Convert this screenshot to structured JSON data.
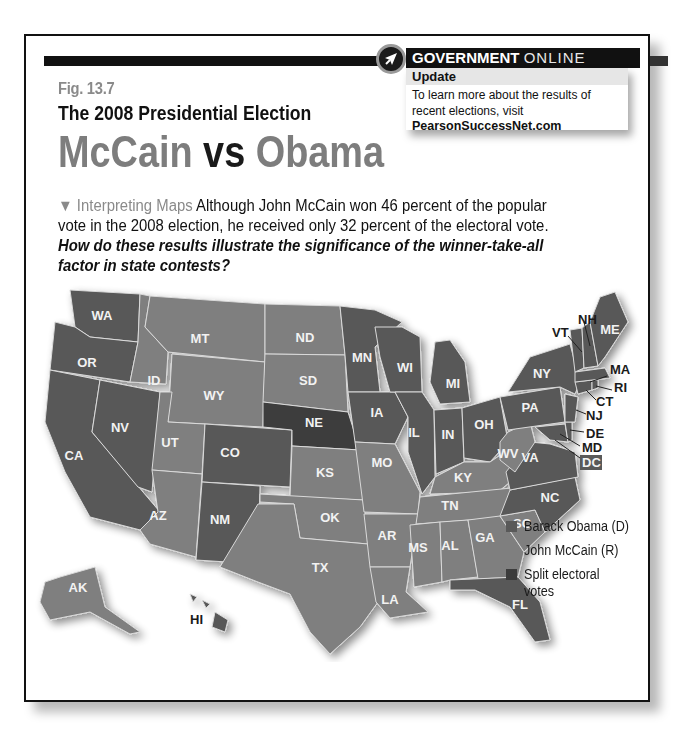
{
  "figure": {
    "number": "Fig. 13.7",
    "subtitle": "The 2008 Presidential Election",
    "title_left": "McCain",
    "title_mid": "vs",
    "title_right": "Obama"
  },
  "gov_online": {
    "icon": "arrow-cursor-icon",
    "heading_bold": "GOVERNMENT",
    "heading_light": "ONLINE",
    "tag": "Update",
    "text": "To learn more about the results of recent elections, visit",
    "link": "PearsonSuccessNet.com"
  },
  "caption": {
    "lead": "▼ Interpreting Maps",
    "body": " Although John McCain won 46 percent of the popular vote in the 2008 election, he received only 32 percent of the electoral vote. ",
    "question": "How do these results illustrate the significance of the winner-take-all factor in state contests?"
  },
  "colors": {
    "obama": "#595959",
    "mccain": "#7f7f7f",
    "split": "#3c3c3c",
    "border": "#d9d9d9"
  },
  "legend": [
    {
      "label": "Barack Obama (D)",
      "key": "obama"
    },
    {
      "label": "John McCain (R)",
      "key": "mccain"
    },
    {
      "label": "Split electoral votes",
      "key": "split"
    }
  ],
  "states": {
    "obama": [
      "WA",
      "OR",
      "CA",
      "NV",
      "CO",
      "NM",
      "MN",
      "WI",
      "IA",
      "IL",
      "MI",
      "IN",
      "OH",
      "PA",
      "NY",
      "VA",
      "NC",
      "FL",
      "ME",
      "NH",
      "VT",
      "MA",
      "RI",
      "CT",
      "NJ",
      "DE",
      "MD",
      "DC",
      "HI"
    ],
    "mccain": [
      "ID",
      "MT",
      "WY",
      "UT",
      "AZ",
      "ND",
      "SD",
      "KS",
      "OK",
      "TX",
      "MO",
      "AR",
      "LA",
      "MS",
      "AL",
      "GA",
      "SC",
      "TN",
      "KY",
      "WV",
      "AK"
    ],
    "split": [
      "NE"
    ]
  },
  "labels": {
    "WA": "WA",
    "OR": "OR",
    "CA": "CA",
    "NV": "NV",
    "ID": "ID",
    "MT": "MT",
    "WY": "WY",
    "UT": "UT",
    "CO": "CO",
    "AZ": "AZ",
    "NM": "NM",
    "ND": "ND",
    "SD": "SD",
    "NE": "NE",
    "KS": "KS",
    "OK": "OK",
    "TX": "TX",
    "MN": "MN",
    "IA": "IA",
    "MO": "MO",
    "AR": "AR",
    "LA": "LA",
    "WI": "WI",
    "IL": "IL",
    "MI": "MI",
    "IN": "IN",
    "OH": "OH",
    "KY": "KY",
    "TN": "TN",
    "MS": "MS",
    "AL": "AL",
    "GA": "GA",
    "FL": "FL",
    "SC": "SC",
    "NC": "NC",
    "VA": "VA",
    "WV": "WV",
    "PA": "PA",
    "NY": "NY",
    "ME": "ME",
    "VT": "VT",
    "NH": "NH",
    "MA": "MA",
    "RI": "RI",
    "CT": "CT",
    "NJ": "NJ",
    "DE": "DE",
    "MD": "MD",
    "DC": "DC",
    "AK": "AK",
    "HI": "HI"
  }
}
